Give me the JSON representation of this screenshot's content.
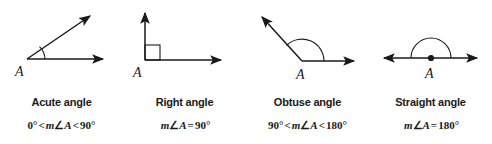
{
  "figure": {
    "name": "types-of-angles-diagram",
    "background_color": "#ffffff",
    "ink_color": "#1a1a1a",
    "vertex_label": "A"
  },
  "panels": [
    {
      "id": "acute",
      "title": "Acute angle",
      "formula": "0° < m∠A < 90°",
      "formula_parts": {
        "lower": "0°",
        "op1": "<",
        "measure_m": "m",
        "measure_angle": "∠",
        "measure_var": "A",
        "op2": "<",
        "upper": "90°"
      },
      "vertex_label": "A",
      "angle_degrees": 30,
      "marker": "arc",
      "rays": [
        "horizontal-right",
        "up-right"
      ]
    },
    {
      "id": "right",
      "title": "Right angle",
      "formula": "m∠A = 90°",
      "formula_parts": {
        "lower": "",
        "op1": "",
        "measure_m": "m",
        "measure_angle": "∠",
        "measure_var": "A",
        "op2": "=",
        "upper": "90°"
      },
      "vertex_label": "A",
      "angle_degrees": 90,
      "marker": "square",
      "rays": [
        "horizontal-right",
        "vertical-up"
      ]
    },
    {
      "id": "obtuse",
      "title": "Obtuse angle",
      "formula": "90° < m∠A < 180°",
      "formula_parts": {
        "lower": "90°",
        "op1": "<",
        "measure_m": "m",
        "measure_angle": "∠",
        "measure_var": "A",
        "op2": "<",
        "upper": "180°"
      },
      "vertex_label": "A",
      "angle_degrees": 135,
      "marker": "arc",
      "rays": [
        "horizontal-right",
        "up-left"
      ]
    },
    {
      "id": "straight",
      "title": "Straight angle",
      "formula": "m∠A = 180°",
      "formula_parts": {
        "lower": "",
        "op1": "",
        "measure_m": "m",
        "measure_angle": "∠",
        "measure_var": "A",
        "op2": "=",
        "upper": "180°"
      },
      "vertex_label": "A",
      "angle_degrees": 180,
      "marker": "arc-with-dot",
      "rays": [
        "horizontal-left",
        "horizontal-right"
      ]
    }
  ]
}
